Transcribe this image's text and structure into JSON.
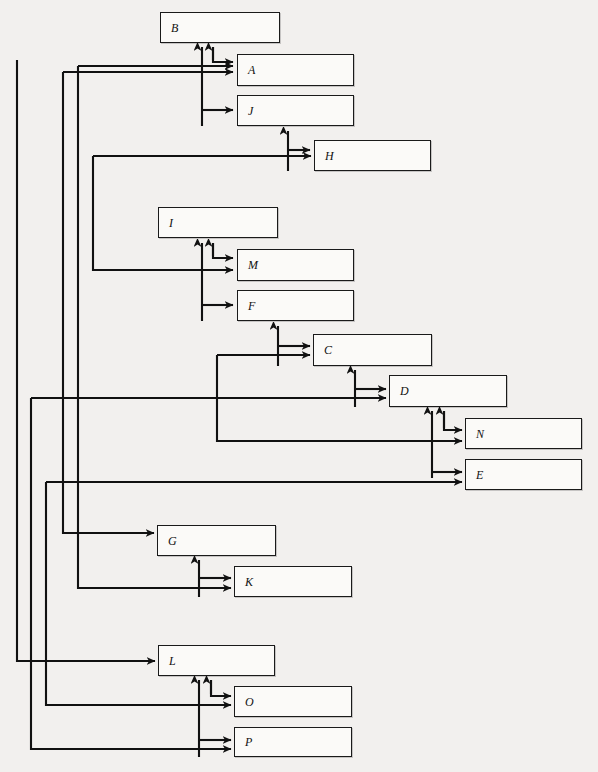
{
  "diagram": {
    "background_color": "#f2f0ee",
    "node_fill": "#fbfaf8",
    "line_color": "#1a1a1a",
    "nodes": [
      {
        "id": "B",
        "label": "B",
        "x": 160,
        "y": 12,
        "w": 120,
        "h": 31
      },
      {
        "id": "A",
        "label": "A",
        "x": 237,
        "y": 54,
        "w": 117,
        "h": 32
      },
      {
        "id": "J",
        "label": "J",
        "x": 237,
        "y": 95,
        "w": 117,
        "h": 31
      },
      {
        "id": "H",
        "label": "H",
        "x": 314,
        "y": 140,
        "w": 117,
        "h": 31
      },
      {
        "id": "I",
        "label": "I",
        "x": 158,
        "y": 207,
        "w": 120,
        "h": 31
      },
      {
        "id": "M",
        "label": "M",
        "x": 237,
        "y": 249,
        "w": 117,
        "h": 32
      },
      {
        "id": "F",
        "label": "F",
        "x": 237,
        "y": 290,
        "w": 117,
        "h": 31
      },
      {
        "id": "C",
        "label": "C",
        "x": 313,
        "y": 334,
        "w": 119,
        "h": 32
      },
      {
        "id": "D",
        "label": "D",
        "x": 389,
        "y": 375,
        "w": 118,
        "h": 32
      },
      {
        "id": "N",
        "label": "N",
        "x": 465,
        "y": 418,
        "w": 117,
        "h": 31
      },
      {
        "id": "E",
        "label": "E",
        "x": 465,
        "y": 459,
        "w": 117,
        "h": 31
      },
      {
        "id": "G",
        "label": "G",
        "x": 157,
        "y": 525,
        "w": 119,
        "h": 31
      },
      {
        "id": "K",
        "label": "K",
        "x": 234,
        "y": 566,
        "w": 118,
        "h": 31
      },
      {
        "id": "L",
        "label": "L",
        "x": 158,
        "y": 645,
        "w": 117,
        "h": 31
      },
      {
        "id": "O",
        "label": "O",
        "x": 234,
        "y": 686,
        "w": 118,
        "h": 31
      },
      {
        "id": "P",
        "label": "P",
        "x": 234,
        "y": 727,
        "w": 118,
        "h": 30
      }
    ],
    "edges": [
      {
        "from": "A",
        "to": "B",
        "kind": "short-up"
      },
      {
        "from": "B",
        "to": "A",
        "kind": "short-down"
      },
      {
        "from": "J",
        "to": "B",
        "kind": "long-up"
      },
      {
        "from": "B",
        "to": "J",
        "kind": "short-down"
      },
      {
        "from": "H",
        "to": "J",
        "kind": "short-up"
      },
      {
        "from": "J",
        "to": "H",
        "kind": "short-down"
      },
      {
        "from": "M",
        "to": "I",
        "kind": "short-up"
      },
      {
        "from": "I",
        "to": "M",
        "kind": "short-down"
      },
      {
        "from": "F",
        "to": "I",
        "kind": "long-up"
      },
      {
        "from": "I",
        "to": "F",
        "kind": "short-down"
      },
      {
        "from": "C",
        "to": "F",
        "kind": "short-up"
      },
      {
        "from": "F",
        "to": "C",
        "kind": "short-down"
      },
      {
        "from": "D",
        "to": "C",
        "kind": "short-up"
      },
      {
        "from": "C",
        "to": "D",
        "kind": "short-down"
      },
      {
        "from": "N",
        "to": "D",
        "kind": "short-up"
      },
      {
        "from": "D",
        "to": "N",
        "kind": "short-down"
      },
      {
        "from": "E",
        "to": "D",
        "kind": "long-up"
      },
      {
        "from": "K",
        "to": "G",
        "kind": "short-up"
      },
      {
        "from": "G",
        "to": "K",
        "kind": "short-down"
      },
      {
        "from": "O",
        "to": "L",
        "kind": "short-up"
      },
      {
        "from": "L",
        "to": "O",
        "kind": "short-down"
      },
      {
        "from": "P",
        "to": "L",
        "kind": "long-up"
      },
      {
        "from": "L",
        "to": "P",
        "kind": "short-down"
      },
      {
        "from": "G",
        "to": "A",
        "kind": "left-bus"
      },
      {
        "from": "K",
        "to": "A",
        "kind": "left-bus"
      },
      {
        "from": "M",
        "to": "H",
        "kind": "left-bus"
      },
      {
        "from": "D",
        "to": "P",
        "kind": "left-bus"
      },
      {
        "from": "E",
        "to": "O",
        "kind": "left-bus"
      },
      {
        "from": "L",
        "to": "outer",
        "kind": "left-bus"
      },
      {
        "from": "N",
        "to": "C",
        "kind": "mid-bus"
      }
    ],
    "buses": [
      {
        "x": 17,
        "label": "bus-outer-1"
      },
      {
        "x": 31,
        "label": "bus-outer-2"
      },
      {
        "x": 46,
        "label": "bus-outer-3"
      },
      {
        "x": 63,
        "label": "bus-inner-1"
      },
      {
        "x": 78,
        "label": "bus-inner-2"
      },
      {
        "x": 93,
        "label": "bus-inner-3"
      },
      {
        "x": 217,
        "label": "bus-mid"
      }
    ]
  }
}
